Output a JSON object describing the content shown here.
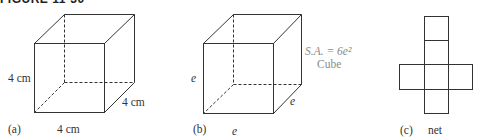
{
  "figure": {
    "title": "FIGURE 11-30"
  },
  "panels": [
    {
      "id": "a",
      "label": "(a)",
      "shape": "cube",
      "dimension_labels": {
        "height": "4 cm",
        "depth": "4 cm",
        "width": "4 cm"
      }
    },
    {
      "id": "b",
      "label": "(b)",
      "shape": "cube",
      "dimension_labels": {
        "height": "e",
        "depth": "e",
        "width": "e"
      },
      "formula": {
        "text": "S.A. = 6e²",
        "name": "Cube"
      }
    },
    {
      "id": "c",
      "label": "(c)",
      "shape": "net",
      "caption": "net"
    }
  ],
  "colors": {
    "line": "#333333",
    "formula_text": "#8a8a8a"
  }
}
